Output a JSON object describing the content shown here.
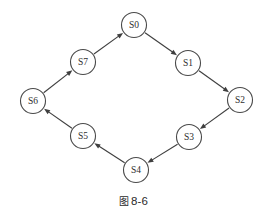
{
  "figure": {
    "caption_glyph": "图",
    "caption_number": "8-6",
    "background_color": "#ffffff",
    "stroke_color": "#3f3f3f",
    "node_fill_color": "#ffffff",
    "label_color": "#2e2e2e"
  },
  "chart_data": {
    "type": "diagram",
    "layout": "octagonal ring",
    "node_radius": 12.5,
    "nodes": [
      {
        "id": "S0",
        "label": "S0",
        "x": 134,
        "y": 25
      },
      {
        "id": "S1",
        "label": "S1",
        "x": 188,
        "y": 63
      },
      {
        "id": "S2",
        "label": "S2",
        "x": 240,
        "y": 100
      },
      {
        "id": "S3",
        "label": "S3",
        "x": 189,
        "y": 137
      },
      {
        "id": "S4",
        "label": "S4",
        "x": 136,
        "y": 170
      },
      {
        "id": "S5",
        "label": "S5",
        "x": 83,
        "y": 136
      },
      {
        "id": "S6",
        "label": "S6",
        "x": 33,
        "y": 101
      },
      {
        "id": "S7",
        "label": "S7",
        "x": 83,
        "y": 62
      }
    ],
    "edges": [
      {
        "from": "S0",
        "to": "S1",
        "directed": true
      },
      {
        "from": "S1",
        "to": "S2",
        "directed": true
      },
      {
        "from": "S2",
        "to": "S3",
        "directed": true
      },
      {
        "from": "S3",
        "to": "S4",
        "directed": true
      },
      {
        "from": "S4",
        "to": "S5",
        "directed": true
      },
      {
        "from": "S5",
        "to": "S6",
        "directed": true
      },
      {
        "from": "S6",
        "to": "S7",
        "directed": true
      },
      {
        "from": "S7",
        "to": "S0",
        "directed": true
      }
    ]
  }
}
